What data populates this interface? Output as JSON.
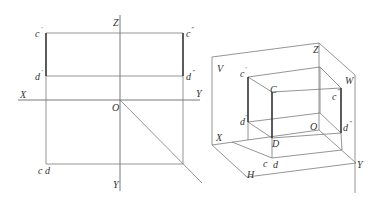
{
  "figure": {
    "left_projection": {
      "description": "Orthographic three-view projection of vertical line segment CD",
      "axes": {
        "x_label": "X",
        "y_right_label": "Y",
        "z_label": "Z",
        "origin_label": "O",
        "y_bottom_label": "Y"
      },
      "points": {
        "c_prime": "c",
        "c_prime_mark": "′",
        "d_prime": "d",
        "d_prime_mark": "′",
        "c_dbl_prime": "c",
        "c_dbl_prime_mark": "″",
        "d_dbl_prime": "d",
        "d_dbl_prime_mark": "″",
        "cd_top": "c d"
      }
    },
    "right_pictorial": {
      "description": "Pictorial (oblique) view of projection planes V, H, W with segment CD",
      "planes": {
        "v_label": "V",
        "w_label": "W",
        "h_label": "H"
      },
      "axes": {
        "x_label": "X",
        "y_label": "Y",
        "z_label": "Z",
        "origin_label": "O"
      },
      "points": {
        "c_prime": "c",
        "c_prime_mark": "′",
        "d_prime": "d",
        "d_prime_mark": "′",
        "C": "C",
        "D": "D",
        "c_dbl_prime": "c",
        "c_dbl_prime_mark": "″",
        "d_dbl_prime": "d",
        "d_dbl_prime_mark": "″",
        "c_h": "c",
        "d_h": "d"
      }
    },
    "colors": {
      "line": "#7a7a7a",
      "bold_line": "#333333",
      "text": "#333333",
      "background": "#ffffff"
    }
  }
}
